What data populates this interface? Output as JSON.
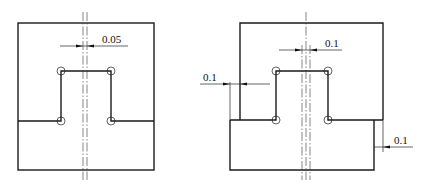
{
  "figures": [
    {
      "id": "left",
      "description": "Punch/die with centered notch, offset 0.05 between centerlines",
      "dimensions": [
        {
          "label": "0.05",
          "position": "top-center"
        }
      ]
    },
    {
      "id": "right",
      "description": "Stepped punch/die with centered notch, offsets of 0.1",
      "dimensions": [
        {
          "label": "0.1",
          "position": "top-center"
        },
        {
          "label": "0.1",
          "position": "left-side"
        },
        {
          "label": "0.1",
          "position": "right-side"
        }
      ]
    }
  ]
}
